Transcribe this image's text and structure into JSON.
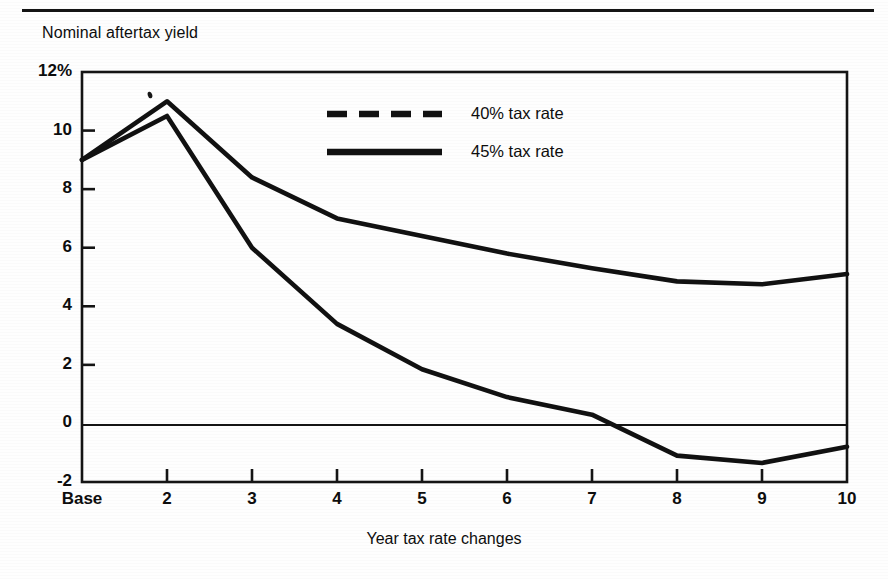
{
  "figure": {
    "top_rule": true,
    "y_axis_title": "Nominal aftertax yield",
    "x_axis_title": "Year tax rate changes"
  },
  "legend": {
    "position": "upper-center-right",
    "entries": [
      {
        "label": "40% tax rate",
        "style": "dashed",
        "color": "#111111"
      },
      {
        "label": "45% tax rate",
        "style": "solid",
        "color": "#111111"
      }
    ]
  },
  "axis": {
    "y_ticks": [
      "12%",
      "10",
      "8",
      "6",
      "4",
      "2",
      "0",
      "-2"
    ],
    "x_ticks": [
      "Base",
      "2",
      "3",
      "4",
      "5",
      "6",
      "7",
      "8",
      "9",
      "10"
    ]
  },
  "chart_data": {
    "type": "line",
    "title": "",
    "xlabel": "Year tax rate changes",
    "ylabel": "Nominal aftertax yield",
    "categories": [
      "Base",
      "2",
      "3",
      "4",
      "5",
      "6",
      "7",
      "8",
      "9",
      "10"
    ],
    "x": [
      0,
      1,
      2,
      3,
      4,
      5,
      6,
      7,
      8,
      9
    ],
    "ylim": [
      -2,
      12
    ],
    "xlim": [
      0,
      9
    ],
    "y_ticks": [
      -2,
      0,
      2,
      4,
      6,
      8,
      10,
      12
    ],
    "y_tick_labels": [
      "-2",
      "0",
      "2",
      "4",
      "6",
      "8",
      "10",
      "12%"
    ],
    "grid": false,
    "zero_line": true,
    "legend_position": "upper right",
    "series": [
      {
        "name": "40% tax rate",
        "style": "solid",
        "color": "#111111",
        "values": [
          9.0,
          10.5,
          6.0,
          3.4,
          1.85,
          0.9,
          0.3,
          -1.1,
          -1.35,
          -0.8
        ]
      },
      {
        "name": "45% tax rate",
        "style": "solid",
        "color": "#111111",
        "values": [
          9.0,
          11.0,
          8.4,
          7.0,
          6.4,
          5.8,
          5.3,
          4.85,
          4.75,
          5.1
        ]
      }
    ]
  }
}
